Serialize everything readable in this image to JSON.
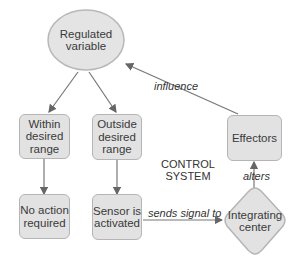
{
  "diagram": {
    "nodes": {
      "regulated_variable": "Regulated variable",
      "within_range": "Within desired range",
      "outside_range": "Outside desired range",
      "no_action": "No action required",
      "sensor": "Sensor is activated",
      "integrating_center": "Integrating center",
      "effectors": "Effectors"
    },
    "edge_labels": {
      "influence": "influence",
      "sends_signal": "sends signal to",
      "alters": "alters"
    },
    "annotation": {
      "line1": "CONTROL",
      "line2": "SYSTEM"
    },
    "colors": {
      "node_fill": "#e2e2e2",
      "node_border": "#b5b5b5",
      "arrow": "#666666"
    }
  }
}
